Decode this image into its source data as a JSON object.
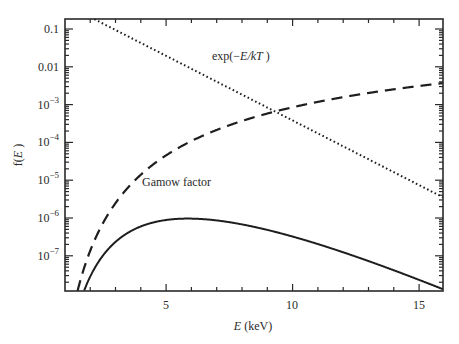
{
  "chart_data": {
    "type": "line",
    "title": "",
    "xlabel": "E (keV)",
    "ylabel": "f(E)",
    "xscale": "linear",
    "yscale": "log",
    "xlim": [
      1.0,
      15.95
    ],
    "ylim": [
      1.2e-08,
      0.15
    ],
    "grid": false,
    "legend": "none (inline annotations)",
    "xticks": [
      5,
      10,
      15
    ],
    "xtick_labels": [
      "5",
      "10",
      "15"
    ],
    "yticks": [
      0.1,
      0.01,
      0.001,
      0.0001,
      1e-05,
      1e-06,
      1e-07
    ],
    "ytick_labels": [
      {
        "base": "0.1",
        "exp": ""
      },
      {
        "base": "0.01",
        "exp": ""
      },
      {
        "base": "10",
        "exp": "−3"
      },
      {
        "base": "10",
        "exp": "−4"
      },
      {
        "base": "10",
        "exp": "−5"
      },
      {
        "base": "10",
        "exp": "−6"
      },
      {
        "base": "10",
        "exp": "−7"
      }
    ],
    "series": [
      {
        "name": "exp(−E/kT)",
        "style": "dotted",
        "model": {
          "kind": "boltzmann",
          "kT_keV": 1.27
        },
        "x": [
          2.4,
          4,
          6,
          8,
          9.2,
          10,
          12,
          14,
          16
        ],
        "values": [
          0.15,
          0.043,
          0.0089,
          0.0018,
          0.00072,
          0.00037,
          7.9e-05,
          1.6e-05,
          3.4e-06
        ]
      },
      {
        "name": "Gamow factor",
        "style": "dashed",
        "model": {
          "kind": "gamow",
          "EG_keV": 500
        },
        "x": [
          1.45,
          2,
          3,
          4,
          6,
          8,
          9.2,
          10,
          12,
          14,
          16
        ],
        "values": [
          8.5e-09,
          1.4e-07,
          2.5e-06,
          1.4e-05,
          0.00011,
          0.00037,
          0.00062,
          0.00085,
          0.0016,
          0.0025,
          0.0037
        ]
      },
      {
        "name": "product (Gamow peak)",
        "style": "solid",
        "model": {
          "kind": "product"
        },
        "x": [
          1.7,
          2,
          3,
          4,
          5,
          5.7,
          7,
          9,
          11,
          13,
          16
        ],
        "values": [
          1.3e-08,
          2.9e-08,
          2.4e-07,
          6.5e-07,
          9.4e-07,
          1e-06,
          8.8e-07,
          5.2e-07,
          2.4e-07,
          9.2e-08,
          1.2e-08
        ]
      }
    ],
    "annotations": [
      {
        "text_prefix": "exp(−",
        "text_italic": "E/kT",
        "text_suffix": " )",
        "x": 8.0,
        "y": 0.005
      },
      {
        "text": "Gamow factor",
        "x": 3.4,
        "y": 4.5e-06
      }
    ]
  },
  "labels": {
    "xlabel_italic": "E",
    "xlabel_rest": " (keV)",
    "ylabel_prefix": "f(",
    "ylabel_italic": "E",
    "ylabel_suffix": " )",
    "anno1_prefix": "exp(−",
    "anno1_italic": "E/kT",
    "anno1_suffix": " )",
    "anno2": "Gamow factor",
    "xtick_5": "5",
    "xtick_10": "10",
    "xtick_15": "15"
  }
}
